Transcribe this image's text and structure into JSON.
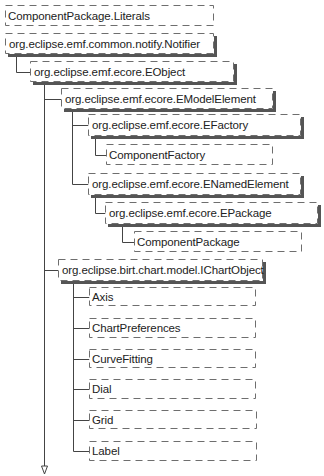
{
  "diagram": {
    "colors": {
      "stroke": "#6e6e6e",
      "shadow": "#555555",
      "text": "#222222",
      "background": "#ffffff"
    },
    "nodes": [
      {
        "id": "literals",
        "label": "ComponentPackage.Literals",
        "x": 5,
        "y": 5,
        "w": 209,
        "h": 21,
        "shadow": false
      },
      {
        "id": "notifier",
        "label": "org.eclipse.emf.common.notify.Notifier",
        "x": 5,
        "y": 33,
        "w": 209,
        "h": 21,
        "shadow": true
      },
      {
        "id": "eobject",
        "label": "org.eclipse.emf.ecore.EObject",
        "x": 30,
        "y": 61,
        "w": 204,
        "h": 21,
        "shadow": true
      },
      {
        "id": "emodelelement",
        "label": "org.eclipse.emf.ecore.EModelElement",
        "x": 61,
        "y": 88,
        "w": 212,
        "h": 21,
        "shadow": true
      },
      {
        "id": "efactory",
        "label": "org.eclipse.emf.ecore.EFactory",
        "x": 88,
        "y": 114,
        "w": 213,
        "h": 22,
        "shadow": true
      },
      {
        "id": "componentfactory",
        "label": "ComponentFactory",
        "x": 106,
        "y": 144,
        "w": 167,
        "h": 21,
        "shadow": false
      },
      {
        "id": "enamedelement",
        "label": "org.eclipse.emf.ecore.ENamedElement",
        "x": 88,
        "y": 173,
        "w": 213,
        "h": 22,
        "shadow": true
      },
      {
        "id": "epackage",
        "label": "org.eclipse.emf.ecore.EPackage",
        "x": 105,
        "y": 202,
        "w": 213,
        "h": 22,
        "shadow": true
      },
      {
        "id": "componentpackage",
        "label": "ComponentPackage",
        "x": 134,
        "y": 231,
        "w": 168,
        "h": 21,
        "shadow": false
      },
      {
        "id": "ichartobject",
        "label": "org.eclipse.birt.chart.model.IChartObject",
        "x": 58,
        "y": 259,
        "w": 205,
        "h": 22,
        "shadow": true
      },
      {
        "id": "axis",
        "label": "Axis",
        "x": 89,
        "y": 287,
        "w": 167,
        "h": 19,
        "shadow": false
      },
      {
        "id": "chartpreferences",
        "label": "ChartPreferences",
        "x": 89,
        "y": 318,
        "w": 167,
        "h": 20,
        "shadow": false
      },
      {
        "id": "curvefitting",
        "label": "CurveFitting",
        "x": 89,
        "y": 349,
        "w": 167,
        "h": 19,
        "shadow": false
      },
      {
        "id": "dial",
        "label": "Dial",
        "x": 89,
        "y": 379,
        "w": 167,
        "h": 20,
        "shadow": false
      },
      {
        "id": "grid",
        "label": "Grid",
        "x": 89,
        "y": 410,
        "w": 168,
        "h": 19,
        "shadow": false
      },
      {
        "id": "label",
        "label": "Label",
        "x": 89,
        "y": 441,
        "w": 168,
        "h": 20,
        "shadow": false
      }
    ],
    "connectors": [
      {
        "from": "notifier",
        "path": [
          [
            16,
            54
          ],
          [
            16,
            72
          ],
          [
            30,
            72
          ]
        ]
      },
      {
        "from": "eobject",
        "path": [
          [
            44,
            82
          ],
          [
            44,
            470
          ]
        ]
      },
      {
        "from": "eobject",
        "path": [
          [
            44,
            99
          ],
          [
            61,
            99
          ]
        ]
      },
      {
        "from": "emodelelement",
        "path": [
          [
            72,
            109
          ],
          [
            72,
            184
          ],
          [
            88,
            184
          ]
        ]
      },
      {
        "from": "emodelelement",
        "path": [
          [
            72,
            125
          ],
          [
            88,
            125
          ]
        ]
      },
      {
        "from": "efactory",
        "path": [
          [
            95,
            136
          ],
          [
            95,
            155
          ],
          [
            106,
            155
          ]
        ]
      },
      {
        "from": "enamedelement",
        "path": [
          [
            95,
            195
          ],
          [
            95,
            213
          ],
          [
            105,
            213
          ]
        ]
      },
      {
        "from": "epackage",
        "path": [
          [
            122,
            224
          ],
          [
            122,
            242
          ],
          [
            134,
            242
          ]
        ]
      },
      {
        "from": "eobject",
        "path": [
          [
            44,
            270
          ],
          [
            58,
            270
          ]
        ]
      },
      {
        "from": "ichartobject",
        "path": [
          [
            73,
            281
          ],
          [
            73,
            451
          ],
          [
            89,
            451
          ]
        ]
      },
      {
        "from": "ichartobject",
        "path": [
          [
            73,
            297
          ],
          [
            89,
            297
          ]
        ]
      },
      {
        "from": "ichartobject",
        "path": [
          [
            73,
            328
          ],
          [
            89,
            328
          ]
        ]
      },
      {
        "from": "ichartobject",
        "path": [
          [
            73,
            359
          ],
          [
            89,
            359
          ]
        ]
      },
      {
        "from": "ichartobject",
        "path": [
          [
            73,
            389
          ],
          [
            89,
            389
          ]
        ]
      },
      {
        "from": "ichartobject",
        "path": [
          [
            73,
            420
          ],
          [
            89,
            420
          ]
        ]
      }
    ],
    "arrow": {
      "x": 44,
      "y": 470,
      "direction": "down",
      "style": "hollow"
    }
  }
}
